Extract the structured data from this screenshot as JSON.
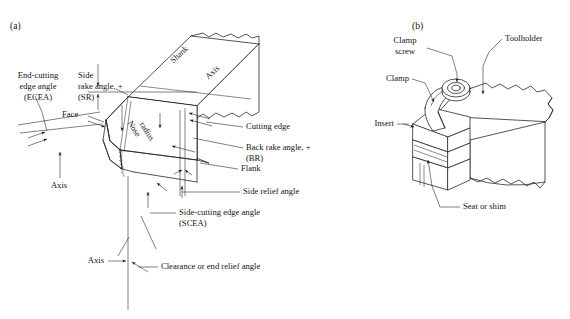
{
  "figure": {
    "panels": [
      {
        "id": "a",
        "label": "(a)",
        "caption_labels": [
          "End-cutting edge angle (ECEA)",
          "Side rake angle, + (SR)",
          "Shank",
          "Axis",
          "Face",
          "Nose radius",
          "Axis",
          "Cutting edge",
          "Back rake angle, + (BR)",
          "Flank",
          "Side relief angle",
          "Side-cutting edge angle (SCEA)",
          "Axis",
          "Clearance or end relief angle"
        ]
      },
      {
        "id": "b",
        "label": "(b)",
        "caption_labels": [
          "Clamp screw",
          "Toolholder",
          "Clamp",
          "Insert",
          "Seat or shim"
        ]
      }
    ]
  },
  "panel_a": {
    "label": "(a)",
    "labels": {
      "ecea_l1": "End-cutting",
      "ecea_l2": "edge angle",
      "ecea_l3": "(ECEA)",
      "side_rake_l1": "Side",
      "side_rake_l2": "rake angle, +",
      "side_rake_l3": "(SR)",
      "shank": "Shank",
      "axis_top": "Axis",
      "face": "Face",
      "nose_l1": "Nose",
      "nose_l2": "radius",
      "axis_left": "Axis",
      "cutting_edge": "Cutting edge",
      "back_rake_l1": "Back rake angle, +",
      "back_rake_l2": "(BR)",
      "flank": "Flank",
      "side_relief": "Side relief angle",
      "scea_l1": "Side-cutting edge angle",
      "scea_l2": "(SCEA)",
      "axis_bottom": "Axis",
      "clearance": "Clearance or end relief angle"
    }
  },
  "panel_b": {
    "label": "(b)",
    "labels": {
      "clamp_screw_l1": "Clamp",
      "clamp_screw_l2": "screw",
      "toolholder": "Toolholder",
      "clamp": "Clamp",
      "insert": "Insert",
      "seat": "Seat or shim"
    }
  },
  "colors": {
    "ink": "#1d1d1d",
    "background": "#ffffff",
    "lead_line": "#2b2b2b"
  }
}
